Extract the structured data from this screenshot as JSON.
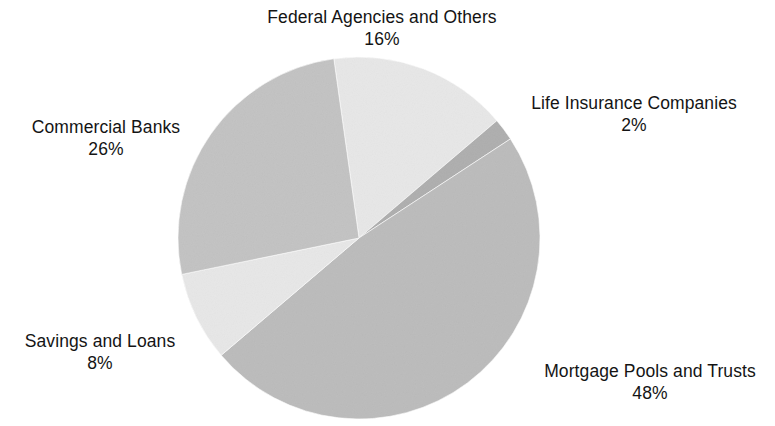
{
  "chart_data": {
    "type": "pie",
    "title": "",
    "subtitle": "",
    "xlabel": "",
    "ylabel": "",
    "legend_position": "none",
    "grid": false,
    "labels_outside": true,
    "value_suffix": "%",
    "categories": [
      "Federal Agencies and Others",
      "Life Insurance Companies",
      "Mortgage Pools and Trusts",
      "Savings and Loans",
      "Commercial Banks"
    ],
    "values": [
      16,
      2,
      48,
      8,
      26
    ],
    "total": 100,
    "slices": [
      {
        "name": "Federal Agencies and Others",
        "value": 16,
        "value_text": "16%",
        "color": "#e8e8e8",
        "label_position": "top"
      },
      {
        "name": "Life Insurance Companies",
        "value": 2,
        "value_text": "2%",
        "color": "#b0b0b0",
        "label_position": "right-top"
      },
      {
        "name": "Mortgage Pools and Trusts",
        "value": 48,
        "value_text": "48%",
        "color": "#bdbdbd",
        "label_position": "right-bottom"
      },
      {
        "name": "Savings and Loans",
        "value": 8,
        "value_text": "8%",
        "color": "#e8e8e8",
        "label_position": "left-bottom"
      },
      {
        "name": "Commercial Banks",
        "value": 26,
        "value_text": "26%",
        "color": "#c4c4c4",
        "label_position": "left-top"
      }
    ],
    "geometry": {
      "center_x": 359,
      "center_y": 238,
      "radius": 181,
      "start_angle_deg": -8
    }
  },
  "labels": {
    "federal": {
      "name": "Federal Agencies and Others",
      "value": "16%"
    },
    "life": {
      "name": "Life Insurance Companies",
      "value": "2%"
    },
    "commercial": {
      "name": "Commercial Banks",
      "value": "26%"
    },
    "savings": {
      "name": "Savings and Loans",
      "value": "8%"
    },
    "mortgage": {
      "name": "Mortgage Pools and Trusts",
      "value": "48%"
    }
  }
}
